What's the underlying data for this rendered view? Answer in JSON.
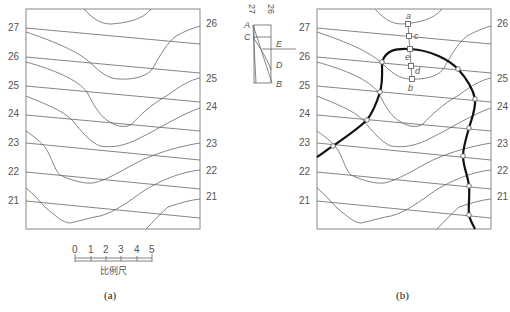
{
  "figure_a": {
    "caption": "(a)",
    "left_labels": [
      "27",
      "26",
      "25",
      "24",
      "23",
      "22",
      "21"
    ],
    "right_labels": [
      "26",
      "25",
      "24",
      "23",
      "22",
      "21"
    ],
    "scale_bar": {
      "ticks": [
        "0",
        "1",
        "2",
        "3",
        "4",
        "5"
      ],
      "label": "比例尺"
    }
  },
  "inset": {
    "header_labels": [
      "27",
      "26"
    ],
    "points": [
      "A",
      "C",
      "E",
      "D",
      "B"
    ]
  },
  "figure_b": {
    "caption": "(b)",
    "left_labels": [
      "27",
      "26",
      "25",
      "24",
      "23",
      "22",
      "21"
    ],
    "right_labels": [
      "26",
      "25",
      "24",
      "23",
      "22",
      "21"
    ],
    "point_labels": [
      "a",
      "c",
      "e",
      "d",
      "b"
    ]
  }
}
